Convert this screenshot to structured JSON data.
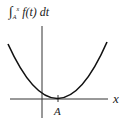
{
  "diagram": {
    "y_label": {
      "integral": "∫",
      "upper": "x",
      "lower": "A",
      "integrand": "f(t) dt"
    },
    "x_label": "x",
    "tick_label": "A",
    "curve": "parabola with minimum 0 at x = A",
    "colors": {
      "curve": "#111111",
      "axes": "#333333"
    }
  }
}
